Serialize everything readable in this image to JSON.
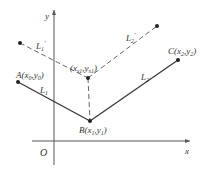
{
  "diagram": {
    "axes": {
      "x_label": "x",
      "y_label": "y",
      "origin_label": "O"
    },
    "points": {
      "A": {
        "name": "A",
        "sub_x": "0",
        "sub_y": "0",
        "label": "A(x0,y0)"
      },
      "B": {
        "name": "B",
        "sub_x": "1",
        "sub_y": "1",
        "label": "B(x1,y1)"
      },
      "C": {
        "name": "C",
        "sub_x": "2",
        "sub_y": "2",
        "label": "C(x2,y2)"
      },
      "S": {
        "name": "",
        "sub_x": "s1",
        "sub_y": "s1",
        "label": "(xs1,ys1)"
      }
    },
    "lines": {
      "L1": {
        "base": "L",
        "sub": "1",
        "prime": ""
      },
      "L2": {
        "base": "L",
        "sub": "2",
        "prime": ""
      },
      "L1p": {
        "base": "L",
        "sub": "1",
        "prime": "′"
      },
      "L2p": {
        "base": "L",
        "sub": "2",
        "prime": "′"
      }
    },
    "colors": {
      "ink": "#333333",
      "axis": "#555555",
      "dashed": "#555555"
    }
  }
}
